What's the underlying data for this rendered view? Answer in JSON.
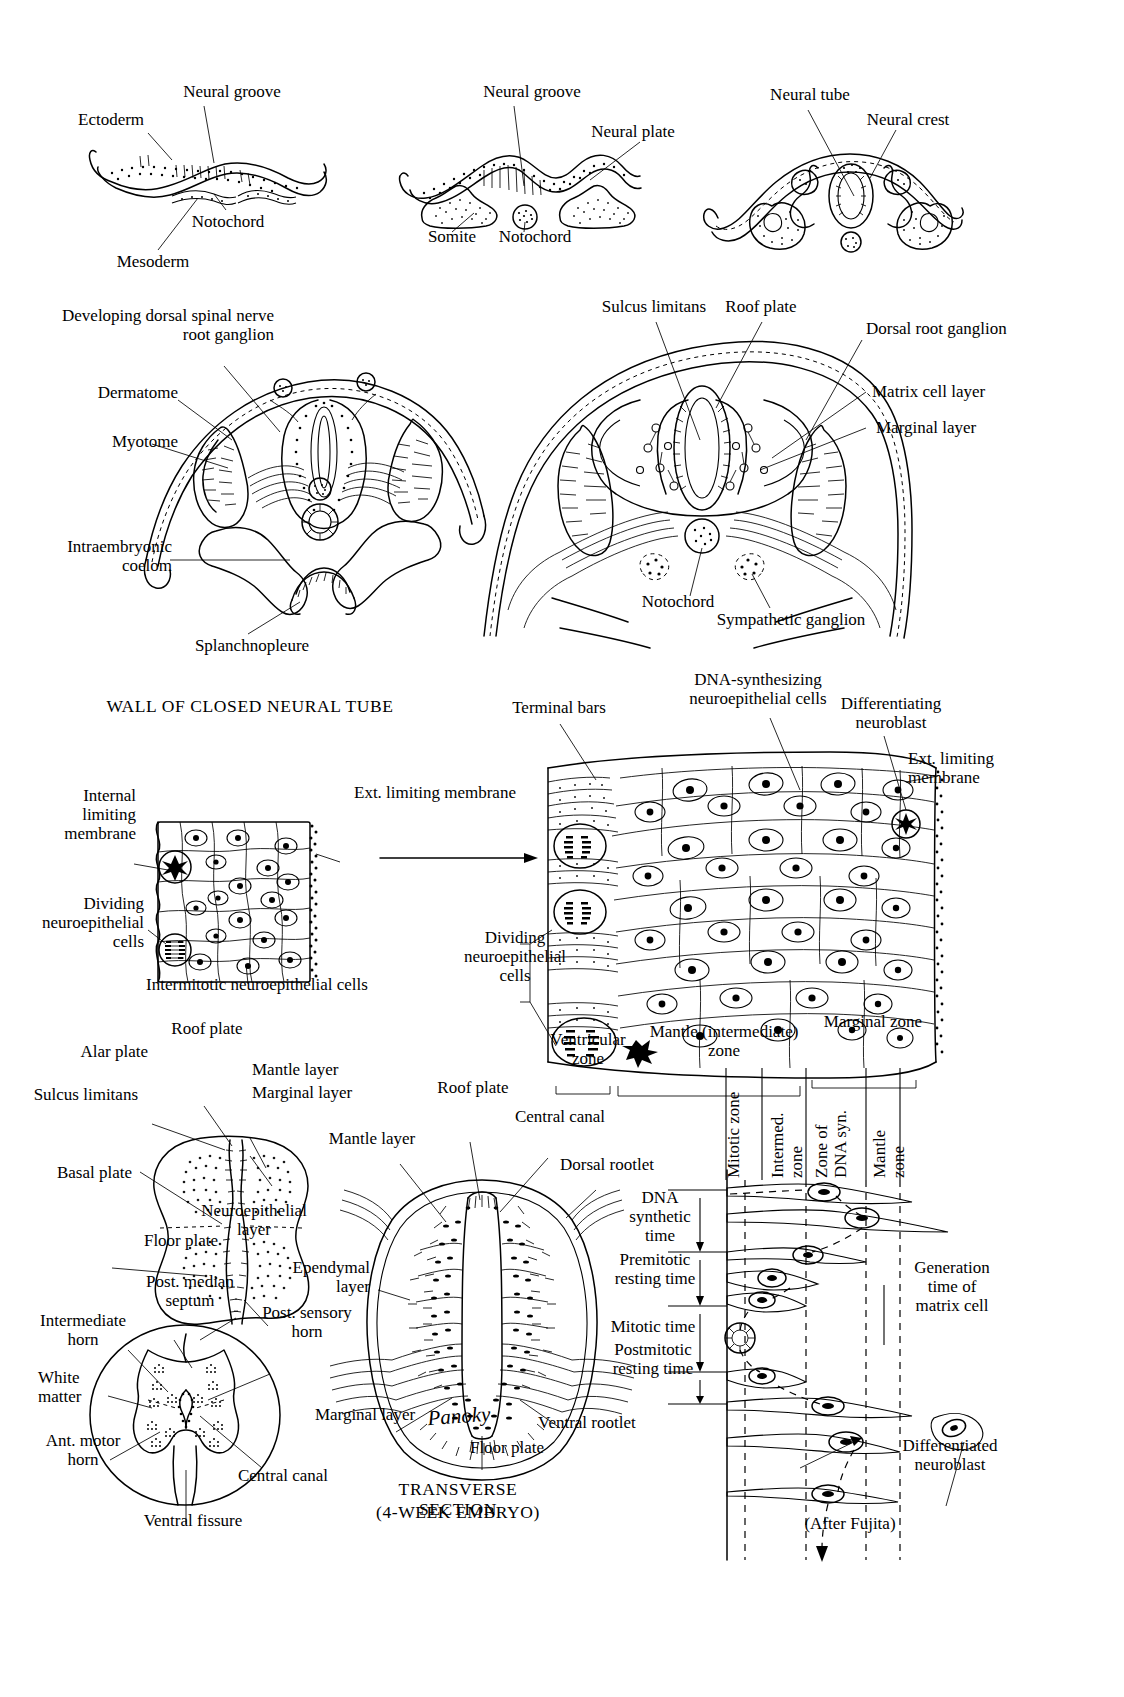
{
  "figure": {
    "title_plate": "Development of the spinal cord and neural tube",
    "attribution": "(After Fujita)",
    "artist_signature": "Panoky"
  },
  "row1": {
    "panel_a": {
      "labels": {
        "ectoderm": "Ectoderm",
        "neural_groove": "Neural groove",
        "notochord": "Notochord",
        "mesoderm": "Mesoderm"
      }
    },
    "panel_b": {
      "labels": {
        "neural_groove": "Neural groove",
        "neural_plate": "Neural plate",
        "somite": "Somite",
        "notochord": "Notochord"
      }
    },
    "panel_c": {
      "labels": {
        "neural_tube": "Neural tube",
        "neural_crest": "Neural crest"
      }
    }
  },
  "row2": {
    "panel_left": {
      "labels": {
        "dorsal_root_ganglion": "Developing dorsal spinal nerve\nroot ganglion",
        "dermatome": "Dermatome",
        "myotome": "Myotome",
        "intraembryonic_coelom": "Intraembryonic\ncoelom",
        "splanchnopleure": "Splanchnopleure"
      }
    },
    "panel_right": {
      "labels": {
        "sulcus_limitans": "Sulcus limitans",
        "roof_plate": "Roof plate",
        "dorsal_root_ganglion": "Dorsal root ganglion",
        "matrix_cell_layer": "Matrix cell layer",
        "marginal_layer": "Marginal layer",
        "notochord": "Notochord",
        "sympathetic_ganglion": "Sympathetic ganglion"
      }
    }
  },
  "row3": {
    "section_title": "WALL OF CLOSED NEURAL TUBE",
    "panel_left": {
      "labels": {
        "internal_limiting_membrane": "Internal\nlimiting\nmembrane",
        "ext_limiting_membrane": "Ext. limiting membrane",
        "dividing_cells": "Dividing\nneuroepithelial\ncells",
        "intermitotic_cells": "Intermitotic neuroepithelial cells"
      }
    },
    "panel_right": {
      "labels": {
        "terminal_bars": "Terminal bars",
        "dna_synthesizing": "DNA-synthesizing\nneuroepithelial cells",
        "differentiating_neuroblast": "Differentiating\nneuroblast",
        "ext_limiting_membrane": "Ext. limiting\nmembrane",
        "dividing_cells": "Dividing\nneuroepithelial\ncells",
        "ventricular_zone": "Ventricular\nzone",
        "mantle_zone": "Mantle (intermediate)\nzone",
        "marginal_zone": "Marginal zone"
      }
    }
  },
  "row4": {
    "panel_left": {
      "labels": {
        "roof_plate": "Roof plate",
        "alar_plate": "Alar plate",
        "mantle_layer": "Mantle layer",
        "marginal_layer": "Marginal layer",
        "sulcus_limitans": "Sulcus limitans",
        "basal_plate": "Basal plate",
        "neuroepithelial_layer": "Neuroepithelial\nlayer",
        "floor_plate": "Floor plate"
      }
    },
    "panel_bottom_left": {
      "labels": {
        "post_median_septum": "Post. median\nseptum",
        "post_sensory_horn": "Post. sensory\nhorn",
        "intermediate_horn": "Intermediate\nhorn",
        "white_matter": "White\nmatter",
        "ant_motor_horn": "Ant. motor\nhorn",
        "central_canal": "Central canal",
        "ventral_fissure": "Ventral fissure"
      }
    },
    "panel_center": {
      "caption_line1": "TRANSVERSE SECTION",
      "caption_line2": "(4-WEEK EMBRYO)",
      "labels": {
        "roof_plate": "Roof plate",
        "central_canal": "Central canal",
        "mantle_layer": "Mantle layer",
        "dorsal_rootlet": "Dorsal rootlet",
        "ependymal_layer": "Ependymal\nlayer",
        "marginal_layer": "Marginal layer",
        "ventral_rootlet": "Ventral rootlet",
        "floor_plate": "Floor plate"
      }
    },
    "panel_fujita": {
      "attribution": "(After Fujita)",
      "zone_headers": [
        "Mitotic zone",
        "Intermed.\nzone",
        "Zone of\nDNA syn.",
        "Mantle\nzone"
      ],
      "time_phases": [
        "DNA\nsynthetic\ntime",
        "Premitotic\nresting time",
        "Mitotic time",
        "Postmitotic\nresting time"
      ],
      "generation_label": "Generation\ntime of\nmatrix cell",
      "outcome_label": "Differentiated\nneuroblast"
    }
  },
  "colors": {
    "ink": "#000000",
    "paper": "#ffffff"
  }
}
